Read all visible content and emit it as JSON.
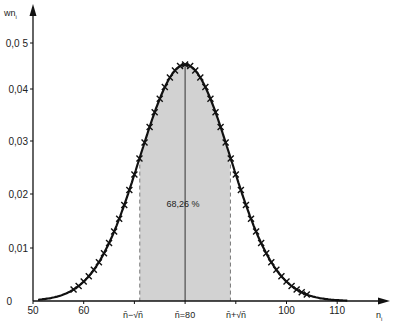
{
  "chart_data": {
    "type": "line",
    "title": "",
    "xlabel": "n_i",
    "ylabel": "w_{n_i}",
    "xlim": [
      50,
      120
    ],
    "ylim": [
      0,
      0.055
    ],
    "x_ticks": [
      50,
      60,
      70,
      80,
      90,
      100,
      110
    ],
    "x_tick_labels": [
      "50",
      "60",
      "",
      "",
      "",
      "100",
      "110"
    ],
    "y_ticks": [
      0,
      0.01,
      0.02,
      0.03,
      0.04,
      0.05
    ],
    "y_tick_labels": [
      "0",
      "0,01",
      "0,02",
      "0,03",
      "0,04",
      "0,0 5"
    ],
    "grid": false,
    "legend": null,
    "series": [
      {
        "name": "normal curve",
        "style": "solid-line",
        "mean": 80,
        "sigma": 8.944,
        "x": [
          50,
          55,
          60,
          65,
          70,
          72,
          74,
          76,
          78,
          80,
          82,
          84,
          86,
          88,
          90,
          95,
          100,
          105,
          110
        ],
        "values": [
          0.0016,
          0.0091,
          0.0184,
          0.0109,
          0.0238,
          0.03,
          0.0356,
          0.0402,
          0.0435,
          0.0446,
          0.0435,
          0.0402,
          0.0356,
          0.03,
          0.0238,
          0.0109,
          0.0037,
          0.0009,
          0.0002
        ]
      },
      {
        "name": "poisson points",
        "style": "x-markers",
        "x_range": [
          58,
          104
        ],
        "note": "x-markers at every integer n_i following the curve"
      }
    ],
    "shaded_region": {
      "from": 71.06,
      "to": 88.94,
      "label": "68,26 %",
      "color": "#cfcfcf"
    },
    "annotations": [
      {
        "x": 71.06,
        "text": "n̄−√n̄"
      },
      {
        "x": 80,
        "text": "n̄=80"
      },
      {
        "x": 88.94,
        "text": "n̄+√n̄"
      },
      {
        "x": 80,
        "y": 0.018,
        "text": "68,26 %"
      }
    ]
  },
  "labels": {
    "y_axis_title": "wn",
    "y_axis_sub": "i",
    "x_axis_title": "n",
    "x_axis_sub": "i",
    "percent": "68,26 %",
    "mean_label": "n̄=80",
    "left_bound": "n̄−√n̄",
    "right_bound": "n̄+√n̄"
  },
  "colors": {
    "curve": "#111111",
    "shade": "#d2d2d2",
    "axis": "#111111",
    "dash": "#777777"
  }
}
